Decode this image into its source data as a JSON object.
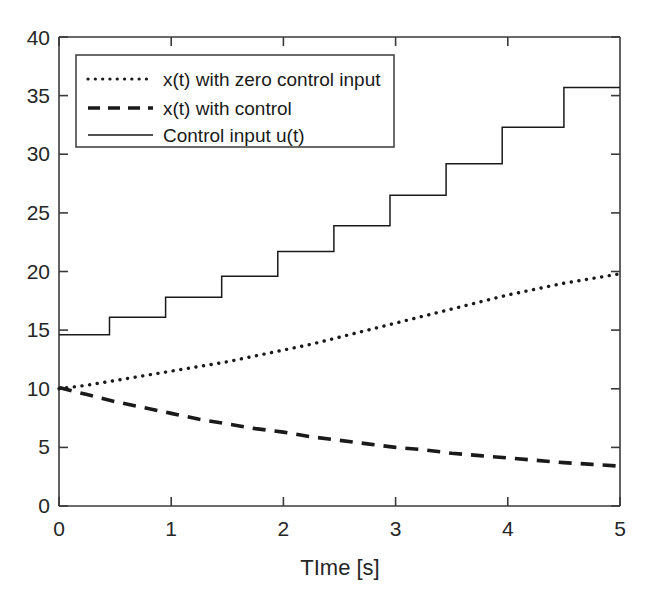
{
  "chart_data": {
    "type": "line",
    "title": "",
    "xlabel": "TIme [s]",
    "ylabel": "",
    "xlim": [
      0,
      5
    ],
    "ylim": [
      0,
      40
    ],
    "grid": false,
    "legend_position": "upper-left-inside",
    "xticks": [
      "0",
      "1",
      "2",
      "3",
      "4",
      "5"
    ],
    "xtick_values": [
      0,
      1,
      2,
      3,
      4,
      5
    ],
    "yticks": [
      "0",
      "5",
      "10",
      "15",
      "20",
      "25",
      "30",
      "35",
      "40"
    ],
    "ytick_values": [
      0,
      5,
      10,
      15,
      20,
      25,
      30,
      35,
      40
    ],
    "series": [
      {
        "name": "x(t) with zero control input",
        "style": "dotted",
        "color": "#1a1a1a",
        "x": [
          0,
          0.25,
          0.5,
          0.75,
          1.0,
          1.25,
          1.5,
          1.75,
          2.0,
          2.25,
          2.5,
          2.75,
          3.0,
          3.25,
          3.5,
          3.75,
          4.0,
          4.25,
          4.5,
          4.75,
          5.0
        ],
        "values": [
          10.0,
          10.3,
          10.7,
          11.1,
          11.5,
          11.9,
          12.3,
          12.8,
          13.3,
          13.8,
          14.4,
          15.0,
          15.6,
          16.2,
          16.8,
          17.4,
          18.0,
          18.5,
          19.0,
          19.4,
          19.8
        ]
      },
      {
        "name": "x(t) with control",
        "style": "dashed",
        "color": "#1a1a1a",
        "x": [
          0,
          0.25,
          0.5,
          0.75,
          1.0,
          1.25,
          1.5,
          1.75,
          2.0,
          2.25,
          2.5,
          2.75,
          3.0,
          3.25,
          3.5,
          3.75,
          4.0,
          4.25,
          4.5,
          4.75,
          5.0
        ],
        "values": [
          10.1,
          9.5,
          8.9,
          8.4,
          7.9,
          7.4,
          7.0,
          6.6,
          6.3,
          5.9,
          5.6,
          5.3,
          5.0,
          4.8,
          4.5,
          4.3,
          4.1,
          3.9,
          3.7,
          3.55,
          3.4
        ]
      },
      {
        "name": "Control input u(t)",
        "style": "solid-staircase",
        "color": "#1a1a1a",
        "step_times": [
          0,
          0.45,
          0.95,
          1.45,
          1.95,
          2.45,
          2.95,
          3.45,
          3.95,
          4.5,
          5.0
        ],
        "values": [
          14.6,
          16.1,
          17.8,
          19.6,
          21.7,
          23.9,
          26.5,
          29.2,
          32.3,
          35.7
        ]
      }
    ],
    "legend_entries": [
      "x(t) with zero control input",
      "x(t) with control",
      "Control input u(t)"
    ]
  },
  "figure": {
    "background_color": "#ffffff",
    "axis_color": "#3a3a3a",
    "line_color": "#1a1a1a"
  }
}
